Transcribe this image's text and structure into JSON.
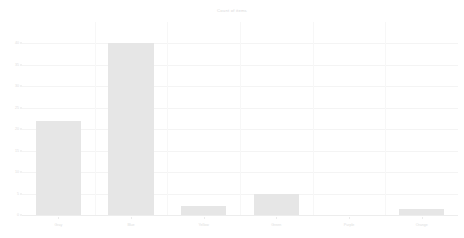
{
  "chart_data": {
    "type": "bar",
    "title": "Count of items",
    "xlabel": "",
    "ylabel": "",
    "categories": [
      "Gray",
      "Blue",
      "Yellow",
      "Green",
      "Purple",
      "Orange"
    ],
    "values": [
      22,
      40,
      2,
      5,
      0,
      1.5
    ],
    "ylim": [
      0,
      45
    ],
    "yticks": [
      0,
      5,
      10,
      15,
      20,
      25,
      30,
      35,
      40
    ],
    "ytick_labels": [
      "0",
      "5",
      "10",
      "15",
      "20",
      "25",
      "30",
      "35",
      "40"
    ],
    "grid": true,
    "legend": false,
    "bar_color": "#e6e6e6",
    "grid_color": "#f4f4f4",
    "text_color": "#dedede",
    "background": "#ffffff"
  }
}
